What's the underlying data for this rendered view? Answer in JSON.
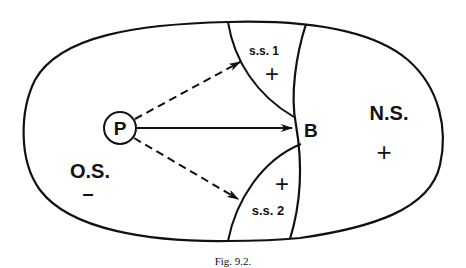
{
  "figure": {
    "caption": "Fig. 9.2.",
    "colors": {
      "line": "#111111",
      "background": "#ffffff"
    },
    "regions": {
      "outer_label": "O.S.",
      "outer_sign": "–",
      "north_label": "N.S.",
      "north_sign": "+",
      "ss1_label": "s.s. 1",
      "ss1_sign": "+",
      "ss2_label": "s.s. 2",
      "ss2_sign": "+"
    },
    "nodes": {
      "p_label": "P",
      "b_label": "B"
    },
    "arrows": [
      {
        "from": "P",
        "to": "B",
        "style": "solid"
      },
      {
        "from": "P",
        "to": "s.s. 1",
        "style": "dashed"
      },
      {
        "from": "P",
        "to": "s.s. 2",
        "style": "dashed"
      }
    ]
  }
}
